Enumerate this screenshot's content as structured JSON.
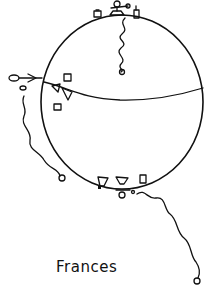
{
  "drawing": {
    "caption": "Frances",
    "description": "Hand-drawn globe with small stick figures and objects standing on its surface at the top, left side and bottom, each with a wavy line (string) trailing to a small loop.",
    "colors": {
      "ink": "#111111",
      "paper": "#ffffff"
    }
  }
}
